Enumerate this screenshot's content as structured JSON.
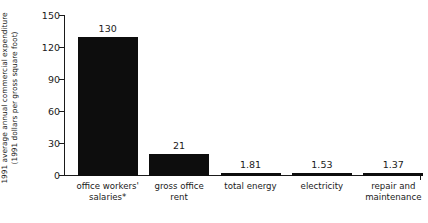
{
  "chart_data": {
    "type": "bar",
    "title": "",
    "xlabel": "",
    "ylabel_line1": "1991 average annual commercial expenditure",
    "ylabel_line2": "(1991 dollars per gross square foot)",
    "categories": [
      "office workers' salaries*",
      "gross office rent",
      "total energy",
      "electricity",
      "repair and maintenance"
    ],
    "category_lines": [
      [
        "office workers'",
        "salaries*"
      ],
      [
        "gross office",
        "rent"
      ],
      [
        "total energy",
        ""
      ],
      [
        "electricity",
        ""
      ],
      [
        "repair and",
        "maintenance"
      ]
    ],
    "values": [
      130,
      21,
      1.81,
      1.53,
      1.37
    ],
    "value_labels": [
      "130",
      "21",
      "1.81",
      "1.53",
      "1.37"
    ],
    "ylim": [
      0,
      150
    ],
    "yticks": [
      0,
      30,
      60,
      90,
      120,
      150
    ],
    "ytick_labels": [
      "0",
      "30",
      "60",
      "90",
      "120",
      "150"
    ],
    "grid": false,
    "legend": false,
    "bar_color": "#0d0d0d",
    "axis_color": "#1a1a1a"
  }
}
